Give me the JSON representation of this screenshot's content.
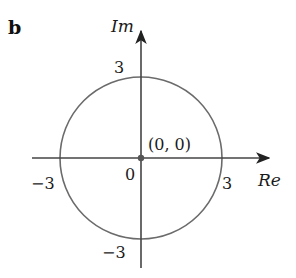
{
  "panel_label": "b",
  "axes": {
    "imag_label": "Im",
    "real_label": "Re"
  },
  "ticks": {
    "top": "3",
    "bottom": "−3",
    "left": "−3",
    "right": "3",
    "origin": "0"
  },
  "origin_point_label": "(0, 0)",
  "circle": {
    "center": [
      0,
      0
    ],
    "radius": 3
  },
  "colors": {
    "axis": "#444444",
    "circle": "#666666",
    "text": "#1a1a1a",
    "point": "#555555"
  }
}
